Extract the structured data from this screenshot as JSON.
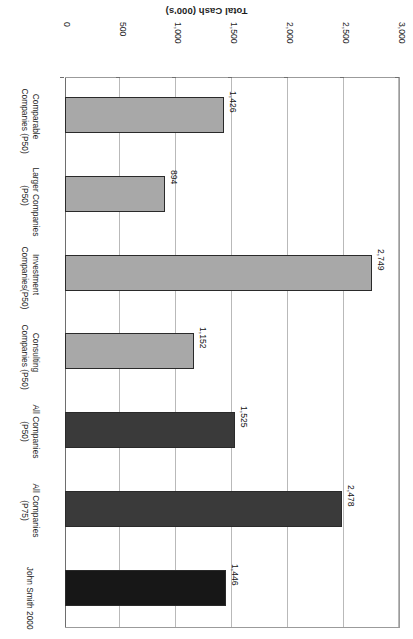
{
  "chart_data": {
    "type": "bar",
    "orientation": "horizontal",
    "title": "",
    "xlabel": "",
    "ylabel": "Total Cash (000's)",
    "axis_title": "Total Cash (000's)",
    "value_axis_ticks": [
      "0",
      "500",
      "1,000",
      "1,500",
      "2,000",
      "2,500",
      "3,000"
    ],
    "value_axis_tick_values": [
      0,
      500,
      1000,
      1500,
      2000,
      2500,
      3000
    ],
    "ylim": [
      0,
      3000
    ],
    "grid": true,
    "legend": "none",
    "rotation_note": "figure rendered upside-down (180 degrees)",
    "categories": [
      "Comparable Companies (P50)",
      "Larger Companies (P50)",
      "Investment Companies(P50)",
      "Consulting Companies (P50)",
      "All Companies (P50)",
      "All Companies (P75)",
      "John Smith 2000"
    ],
    "values": [
      1426,
      894,
      2749,
      1152,
      1525,
      2478,
      1446
    ],
    "value_labels": [
      "1,426",
      "894",
      "2,749",
      "1,152",
      "1,525",
      "2,478",
      "1,446"
    ],
    "bars": [
      {
        "category_line1": "Comparable",
        "category_line2": "Companies (P50)",
        "value": 1426,
        "label": "1,426",
        "color": "#a8a8a8"
      },
      {
        "category_line1": "Larger Companies",
        "category_line2": "(P50)",
        "value": 894,
        "label": "894",
        "color": "#a8a8a8"
      },
      {
        "category_line1": "Investment",
        "category_line2": "Companies(P50)",
        "value": 2749,
        "label": "2,749",
        "color": "#a8a8a8"
      },
      {
        "category_line1": "Consulting",
        "category_line2": "Companies (P50)",
        "value": 1152,
        "label": "1,152",
        "color": "#a8a8a8"
      },
      {
        "category_line1": "All Companies",
        "category_line2": "(P50)",
        "value": 1525,
        "label": "1,525",
        "color": "#3a3a3a"
      },
      {
        "category_line1": "All Companies",
        "category_line2": "(P75)",
        "value": 2478,
        "label": "2,478",
        "color": "#3a3a3a"
      },
      {
        "category_line1": "John Smith 2000",
        "category_line2": "",
        "value": 1446,
        "label": "1,446",
        "color": "#171717"
      }
    ],
    "colors": {
      "bar_light": "#a8a8a8",
      "bar_dark": "#3a3a3a",
      "bar_black": "#171717",
      "bar_border": "#2a2a2a",
      "gridline": "#b9b9b9",
      "axis": "#6e6e6e",
      "text": "#1d1d1d",
      "background": "#ffffff"
    }
  }
}
